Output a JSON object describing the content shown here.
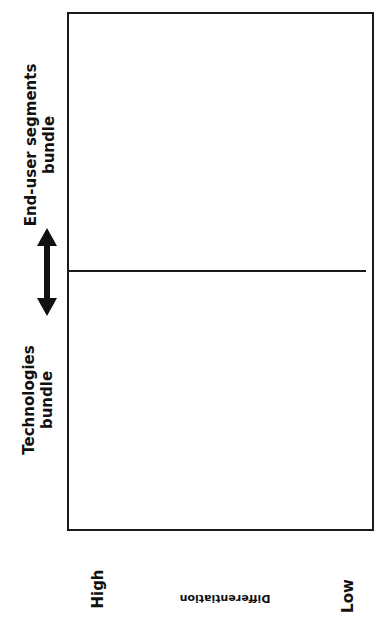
{
  "segments": {
    "top": {
      "line1": "End-user segments",
      "line2": "bundle"
    },
    "bottom": {
      "line1": "Technologies",
      "line2": "bundle"
    }
  },
  "arrow": {
    "icon": "double-arrow-vertical-icon"
  },
  "axis": {
    "high_label": "High",
    "title": "Differentiation",
    "low_label": "Low"
  },
  "colors": {
    "line": "#1a1a1a",
    "background": "#ffffff"
  }
}
